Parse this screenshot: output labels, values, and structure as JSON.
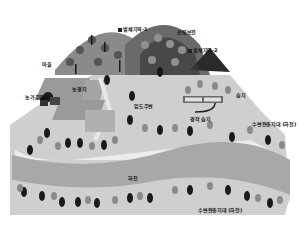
{
  "diagram": {
    "type": "landscape-illustration",
    "palette": {
      "background": "#ffffff",
      "mountain_dark": "#3a3a3a",
      "mountain_mid": "#8a8a8a",
      "ground_light": "#cfcfcf",
      "field": "#9a9a9a",
      "river": "#a8a8a8",
      "sand": "#ececec",
      "tree_dark": "#1a1a1a",
      "tree_mid": "#7a7a7a"
    },
    "labels": {
      "peak_left": "벌채지역-1",
      "peak_right": "산림보전",
      "peak_small": "벌채지역-2",
      "village": "마을",
      "farmhouse": "농가주택",
      "field": "농경지",
      "forest_road": "임도주변",
      "pond": "습지",
      "orchard": "경작 습지",
      "riparian_upper": "수변완충지대 (하천)",
      "river": "하천",
      "riparian_lower": "수변완충지대 (하천)"
    }
  }
}
